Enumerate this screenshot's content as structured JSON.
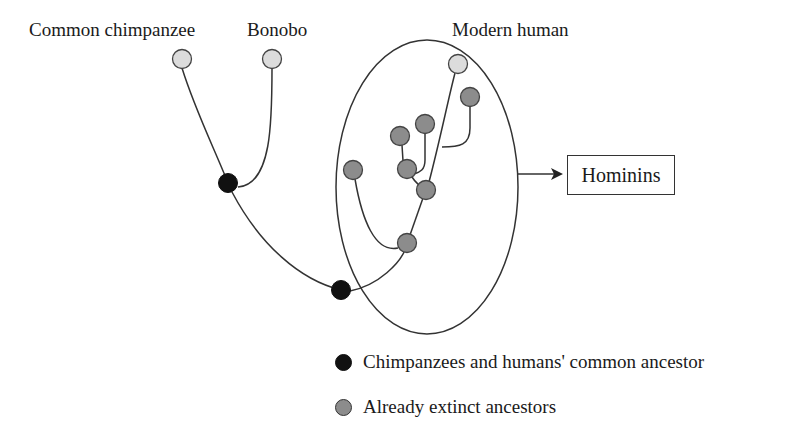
{
  "title_labels": {
    "common_chimpanzee": "Common chimpanzee",
    "bonobo": "Bonobo",
    "modern_human": "Modern human"
  },
  "group_box": {
    "label": "Hominins"
  },
  "legend": [
    {
      "label": "Chimpanzees and humans' common ancestor",
      "color": "#111111"
    },
    {
      "label": "Already extinct ancestors",
      "color": "#8c8c8c"
    }
  ],
  "colors": {
    "living_species": "#dcdcdc",
    "extinct_ancestor": "#8c8c8c",
    "common_ancestor": "#111111",
    "line": "#333333"
  }
}
